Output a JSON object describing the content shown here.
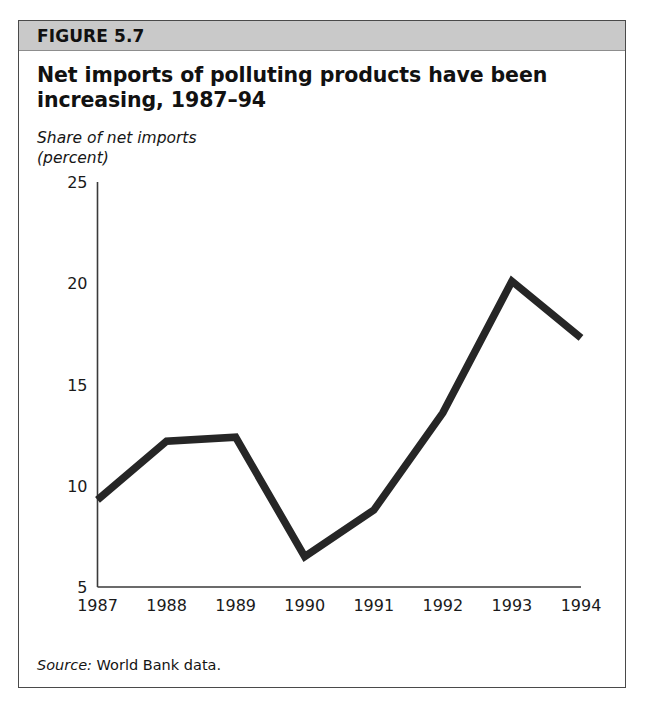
{
  "figure": {
    "label": "FIGURE 5.7",
    "title": "Net imports of polluting products have been increasing, 1987–94",
    "axis_caption_line1": "Share of net imports",
    "axis_caption_line2": "(percent)",
    "source_word": "Source:",
    "source_text": " World Bank data."
  },
  "colors": {
    "header_bar": "#c9c9c9",
    "border": "#4a4a4a",
    "line": "#262626",
    "axis": "#3a3a3a",
    "text": "#1a1a1a"
  },
  "chart_data": {
    "type": "line",
    "title": "Net imports of polluting products have been increasing, 1987–94",
    "xlabel": "",
    "ylabel": "Share of net imports (percent)",
    "categories": [
      "1987",
      "1988",
      "1989",
      "1990",
      "1991",
      "1992",
      "1993",
      "1994"
    ],
    "x": [
      1987,
      1988,
      1989,
      1990,
      1991,
      1992,
      1993,
      1994
    ],
    "values": [
      9.3,
      12.2,
      12.4,
      6.5,
      8.8,
      13.6,
      20.1,
      17.3
    ],
    "series": [
      {
        "name": "Share of net imports (percent)",
        "values": [
          9.3,
          12.2,
          12.4,
          6.5,
          8.8,
          13.6,
          20.1,
          17.3
        ]
      }
    ],
    "ylim": [
      5,
      25
    ],
    "yticks": [
      5,
      10,
      15,
      20,
      25
    ],
    "ytick_labels": [
      "5",
      "10",
      "15",
      "20",
      "25"
    ],
    "xtick_labels": [
      "1987",
      "1988",
      "1989",
      "1990",
      "1991",
      "1992",
      "1993",
      "1994"
    ],
    "grid": false,
    "legend": false,
    "legend_position": "none",
    "annotations": [
      "Source: World Bank data."
    ]
  }
}
